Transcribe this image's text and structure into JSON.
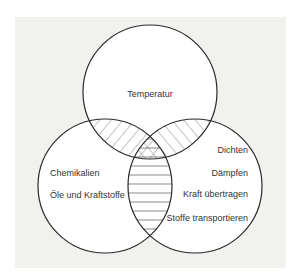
{
  "diagram": {
    "type": "venn-3",
    "colors": {
      "background_panel": "#f1f1ee",
      "circle_fill": "#ffffff",
      "stroke": "#2a2a2a",
      "text": "#333333"
    },
    "sets": [
      {
        "id": "top",
        "items": [
          "Temperatur"
        ]
      },
      {
        "id": "left",
        "items": [
          "Chemikalien",
          "Öle und Kraftstoffe"
        ]
      },
      {
        "id": "right",
        "items": [
          "Dichten",
          "Dämpfen",
          "Kraft übertragen",
          "Stoffe transportieren"
        ]
      }
    ],
    "overlap_patterns": {
      "top_left": "diagonal-hatch",
      "top_right": "diagonal-hatch-reverse",
      "left_right": "horizontal-lines",
      "all_three": "cross-hatch"
    }
  }
}
